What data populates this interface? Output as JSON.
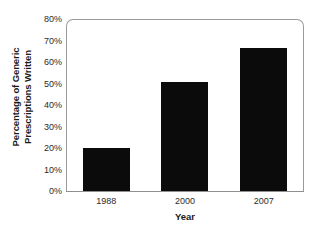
{
  "chart_data": {
    "type": "bar",
    "title": "",
    "categories": [
      "1988",
      "2000",
      "2007"
    ],
    "values": [
      20,
      51,
      67
    ],
    "value_unit": "%",
    "series": [
      {
        "name": "Percentage of Generic Prescriptions Written",
        "values": [
          20,
          51,
          67
        ]
      }
    ],
    "xlabel": "Year",
    "ylabel": "Percentage of Generic Prescriptions Written",
    "ylabel_line1": "Percentage of Generic",
    "ylabel_line2": "Prescriptions Written",
    "ylim": [
      0,
      80
    ],
    "ytick_step": 10,
    "ytick_labels": [
      "80%",
      "70%",
      "60%",
      "50%",
      "40%",
      "30%",
      "20%",
      "10%",
      "0%"
    ],
    "ytick_values": [
      80,
      70,
      60,
      50,
      40,
      30,
      20,
      10,
      0
    ],
    "grid": false,
    "legend": false,
    "legend_position": "none",
    "bar_color": "#0b0b0b",
    "frame_color": "#9a9a9a",
    "background_color": "#ffffff"
  }
}
